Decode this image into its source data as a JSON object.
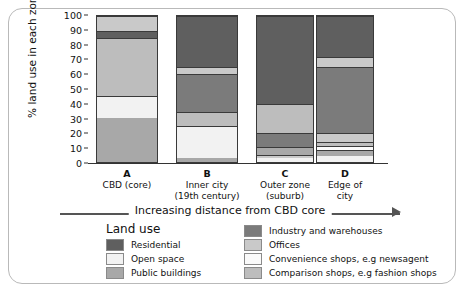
{
  "chart_data": {
    "type": "bar",
    "stacked": true,
    "title": "",
    "xlabel": "Increasing distance from CBD core",
    "ylabel": "% land use in each zone",
    "ylim": [
      0,
      100
    ],
    "yticks": [
      0,
      10,
      20,
      30,
      40,
      50,
      60,
      70,
      80,
      90,
      100
    ],
    "grid": false,
    "legend_title": "Land use",
    "legend_position": "bottom",
    "categories": [
      "A",
      "B",
      "C",
      "D"
    ],
    "category_captions": [
      "CBD (core)",
      "Inner city\n(19th century)",
      "Outer zone\n(suburb)",
      "Edge of\ncity"
    ],
    "series": [
      {
        "name": "Residential",
        "color": "#5f5f5f",
        "values": [
          5,
          35,
          60,
          28
        ]
      },
      {
        "name": "Open space",
        "color": "#f2f2f2",
        "values": [
          15,
          22,
          3,
          4
        ]
      },
      {
        "name": "Public buildings",
        "color": "#a8a8a8",
        "values": [
          30,
          3,
          5,
          6
        ]
      },
      {
        "name": "Industry and warehouses",
        "color": "#7b7b7b",
        "values": [
          0,
          26,
          10,
          45
        ]
      },
      {
        "name": "Offices",
        "color": "#c9c9c9",
        "values": [
          10,
          5,
          2,
          7
        ]
      },
      {
        "name": "Convenience shops, e.g newsagent",
        "color": "#fafafa",
        "values": [
          0,
          0,
          0,
          3
        ]
      },
      {
        "name": "Comparison shops, e.g fashion shops",
        "color": "#bdbdbd",
        "values": [
          40,
          9,
          20,
          7
        ]
      }
    ],
    "bars": [
      {
        "label": "A",
        "segments": [
          {
            "name": "Public buildings",
            "from": 0,
            "to": 30,
            "color": "#a8a8a8"
          },
          {
            "name": "Open space",
            "from": 30,
            "to": 45,
            "color": "#f2f2f2"
          },
          {
            "name": "Comparison shops, e.g fashion shops",
            "from": 45,
            "to": 85,
            "color": "#bdbdbd"
          },
          {
            "name": "Residential",
            "from": 85,
            "to": 90,
            "color": "#5f5f5f"
          },
          {
            "name": "Offices",
            "from": 90,
            "to": 100,
            "color": "#c9c9c9"
          }
        ]
      },
      {
        "label": "B",
        "segments": [
          {
            "name": "Public buildings",
            "from": 0,
            "to": 3,
            "color": "#a8a8a8"
          },
          {
            "name": "Open space",
            "from": 3,
            "to": 25,
            "color": "#f2f2f2"
          },
          {
            "name": "Comparison shops, e.g fashion shops",
            "from": 25,
            "to": 34,
            "color": "#bdbdbd"
          },
          {
            "name": "Industry and warehouses",
            "from": 34,
            "to": 60,
            "color": "#7b7b7b"
          },
          {
            "name": "Offices",
            "from": 60,
            "to": 65,
            "color": "#c9c9c9"
          },
          {
            "name": "Residential",
            "from": 65,
            "to": 100,
            "color": "#5f5f5f"
          }
        ]
      },
      {
        "label": "C",
        "segments": [
          {
            "name": "Open space",
            "from": 0,
            "to": 3,
            "color": "#f2f2f2"
          },
          {
            "name": "Offices",
            "from": 3,
            "to": 5,
            "color": "#c9c9c9"
          },
          {
            "name": "Public buildings",
            "from": 5,
            "to": 10,
            "color": "#a8a8a8"
          },
          {
            "name": "Industry and warehouses",
            "from": 10,
            "to": 20,
            "color": "#7b7b7b"
          },
          {
            "name": "Comparison shops, e.g fashion shops",
            "from": 20,
            "to": 40,
            "color": "#bdbdbd"
          },
          {
            "name": "Residential",
            "from": 40,
            "to": 100,
            "color": "#5f5f5f"
          }
        ]
      },
      {
        "label": "D",
        "segments": [
          {
            "name": "Open space",
            "from": 0,
            "to": 4,
            "color": "#f2f2f2"
          },
          {
            "name": "Public buildings",
            "from": 4,
            "to": 8,
            "color": "#a8a8a8"
          },
          {
            "name": "Convenience shops, e.g newsagent",
            "from": 8,
            "to": 11,
            "color": "#fafafa"
          },
          {
            "name": "Comparison shops, e.g fashion shops",
            "from": 11,
            "to": 14,
            "color": "#bdbdbd"
          },
          {
            "name": "Offices",
            "from": 14,
            "to": 20,
            "color": "#c9c9c9"
          },
          {
            "name": "Industry and warehouses",
            "from": 20,
            "to": 65,
            "color": "#7b7b7b"
          },
          {
            "name": "Offices",
            "from": 65,
            "to": 72,
            "color": "#c9c9c9"
          },
          {
            "name": "Residential",
            "from": 72,
            "to": 100,
            "color": "#5f5f5f"
          }
        ]
      }
    ]
  },
  "axis": {
    "ylabel": "% land use in each zone",
    "xaxis_arrow_text": "Increasing distance from CBD core"
  },
  "legend": {
    "title": "Land use",
    "left_column": [
      {
        "label": "Residential",
        "color": "#5f5f5f"
      },
      {
        "label": "Open space",
        "color": "#f2f2f2"
      },
      {
        "label": "Public buildings",
        "color": "#a8a8a8"
      }
    ],
    "right_column": [
      {
        "label": "Industry and warehouses",
        "color": "#7b7b7b"
      },
      {
        "label": "Offices",
        "color": "#c9c9c9"
      },
      {
        "label": "Convenience shops, e.g newsagent",
        "color": "#fafafa"
      },
      {
        "label": "Comparison shops, e.g fashion shops",
        "color": "#bdbdbd"
      }
    ]
  }
}
